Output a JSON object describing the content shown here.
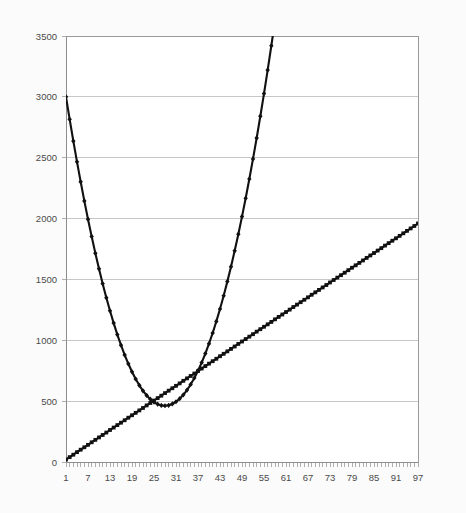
{
  "chart_data": {
    "type": "line",
    "title": "",
    "subtitle": "",
    "xlabel": "",
    "ylabel": "",
    "xlim": [
      1,
      97
    ],
    "ylim": [
      0,
      3500
    ],
    "yticks": [
      0,
      500,
      1000,
      1500,
      2000,
      2500,
      3000,
      3500
    ],
    "ytick_labels": [
      "0",
      "500",
      "1000",
      "1500",
      "2000",
      "2500",
      "3000",
      "3500"
    ],
    "xtick_labels": [
      "1",
      "7",
      "13",
      "19",
      "25",
      "31",
      "37",
      "43",
      "49",
      "55",
      "61",
      "67",
      "73",
      "79",
      "85",
      "91",
      "97"
    ],
    "xtick_step": 6,
    "grid": "horizontal",
    "legend": "none",
    "x": [
      1,
      2,
      3,
      4,
      5,
      6,
      7,
      8,
      9,
      10,
      11,
      12,
      13,
      14,
      15,
      16,
      17,
      18,
      19,
      20,
      21,
      22,
      23,
      24,
      25,
      26,
      27,
      28,
      29,
      30,
      31,
      32,
      33,
      34,
      35,
      36,
      37,
      38,
      39,
      40,
      41,
      42,
      43,
      44,
      45,
      46,
      47,
      48,
      49,
      50,
      51,
      52,
      53,
      54,
      55,
      56,
      57,
      58,
      59,
      60,
      61,
      62,
      63,
      64,
      65,
      66,
      67,
      68,
      69,
      70,
      71,
      72,
      73,
      74,
      75,
      76,
      77,
      78,
      79,
      80,
      81,
      82,
      83,
      84,
      85,
      86,
      87,
      88,
      89,
      90,
      91,
      92,
      93,
      94,
      95,
      96,
      97
    ],
    "series": [
      {
        "name": "u-curve",
        "marker": "diamond",
        "color": "#111111",
        "values": [
          3000,
          2815,
          2637,
          2466,
          2302,
          2145,
          1995,
          1852,
          1716,
          1587,
          1465,
          1350,
          1242,
          1141,
          1047,
          960,
          880,
          807,
          741,
          682,
          630,
          585,
          547,
          516,
          492,
          475,
          465,
          462,
          466,
          477,
          495,
          520,
          552,
          591,
          637,
          690,
          750,
          817,
          891,
          972,
          1060,
          1155,
          1257,
          1366,
          1482,
          1605,
          1735,
          1872,
          2016,
          2167,
          2325,
          2490,
          2662,
          2841,
          3027,
          3220,
          3420,
          3627,
          3841,
          4062,
          4290,
          4525,
          4767,
          5016,
          5272,
          5535,
          5805,
          6082,
          6366,
          6657,
          6955,
          7260,
          7572,
          7891,
          8217,
          8550,
          8890,
          9237,
          9591,
          9952,
          10320,
          10695,
          11077,
          11466,
          11862,
          12265,
          12675,
          13092,
          13516,
          13947,
          14385,
          14830,
          15282,
          15741,
          16207,
          16680,
          17160
        ]
      },
      {
        "name": "linear",
        "marker": "square",
        "color": "#222222",
        "values": [
          20,
          40,
          60,
          81,
          101,
          121,
          141,
          162,
          182,
          202,
          222,
          242,
          263,
          283,
          303,
          323,
          343,
          364,
          384,
          404,
          424,
          444,
          465,
          485,
          505,
          525,
          545,
          566,
          586,
          606,
          626,
          646,
          667,
          687,
          707,
          727,
          747,
          768,
          788,
          808,
          828,
          848,
          869,
          889,
          909,
          929,
          949,
          970,
          990,
          1010,
          1030,
          1050,
          1071,
          1091,
          1111,
          1131,
          1151,
          1172,
          1192,
          1212,
          1232,
          1252,
          1273,
          1293,
          1313,
          1333,
          1353,
          1374,
          1394,
          1414,
          1434,
          1454,
          1475,
          1495,
          1515,
          1535,
          1555,
          1576,
          1596,
          1616,
          1636,
          1656,
          1677,
          1697,
          1717,
          1737,
          1757,
          1778,
          1798,
          1818,
          1838,
          1858,
          1879,
          1899,
          1919,
          1939,
          1960
        ]
      }
    ],
    "annotations": {
      "curve_start_value": 3000,
      "curve_min_value": 500,
      "curve_min_x": 51,
      "curve_end_value": 2800,
      "line_start_value": 20,
      "line_end_value": 1960,
      "first_crossing_x": 35,
      "first_crossing_value": 700,
      "second_crossing_x": 85,
      "second_crossing_value": 1700
    }
  },
  "colors": {
    "background": "#fbfbfb",
    "plot_background": "#ffffff",
    "gridline": "#b9b9b9",
    "axis": "#8e8e8e",
    "series": "#111111",
    "tick_text": "#4a4a4a"
  }
}
